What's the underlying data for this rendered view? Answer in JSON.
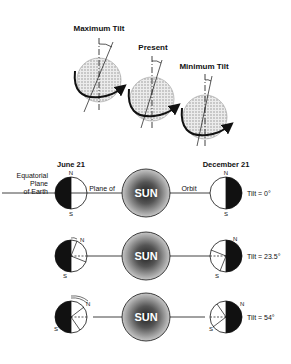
{
  "top_section": {
    "globes": [
      {
        "label": "Maximum Tilt"
      },
      {
        "label": "Present"
      },
      {
        "label": "Minimum Tilt"
      }
    ]
  },
  "orbit_section": {
    "june_label": "June 21",
    "december_label": "December 21",
    "equatorial_label_1": "Equatorial",
    "equatorial_label_2": "Plane",
    "equatorial_label_3": "of Earth",
    "plane_of_label": "Plane of",
    "orbit_label": "Orbit",
    "north": "N",
    "south": "S",
    "sun_label": "SUN",
    "rows": [
      {
        "tilt_label": "Tilt = 0°"
      },
      {
        "tilt_label": "Tilt = 23.5°"
      },
      {
        "tilt_label": "Tilt = 54°"
      }
    ]
  },
  "colors": {
    "ink": "#111111",
    "globe_fill": "#d8d8d8",
    "sun_dark": "#3a3a3a",
    "sun_light": "#bdbdbd"
  }
}
